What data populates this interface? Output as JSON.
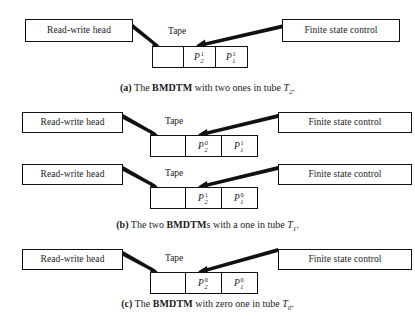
{
  "figure": {
    "background_color": "#ffffff",
    "line_color": "#111111",
    "panels": [
      {
        "id": "a",
        "caption": {
          "label": "(a)",
          "text_before": "The ",
          "acronym": "BMDTM",
          "text_after": " with two ones in tube ",
          "tube_letter": "T",
          "tube_index": "2",
          "period": "."
        },
        "machines": [
          {
            "left_box_label": "Read-write head",
            "right_box_label": "Finite state control",
            "tape_label": "Tape",
            "cells": [
              {
                "blank": true,
                "symbol": "",
                "subscript": "",
                "superscript": ""
              },
              {
                "blank": false,
                "symbol": "P",
                "subscript": "2",
                "superscript": "1"
              },
              {
                "blank": false,
                "symbol": "P",
                "subscript": "1",
                "superscript": "1"
              }
            ]
          }
        ]
      },
      {
        "id": "b",
        "caption": {
          "label": "(b)",
          "text_before": "The two ",
          "acronym": "BMDTM",
          "text_after": "s with a one in tube ",
          "tube_letter": "T",
          "tube_index": "1",
          "period": "."
        },
        "machines": [
          {
            "left_box_label": "Read-write head",
            "right_box_label": "Finite state control",
            "tape_label": "Tape",
            "cells": [
              {
                "blank": true,
                "symbol": "",
                "subscript": "",
                "superscript": ""
              },
              {
                "blank": false,
                "symbol": "P",
                "subscript": "2",
                "superscript": "0"
              },
              {
                "blank": false,
                "symbol": "P",
                "subscript": "1",
                "superscript": "1"
              }
            ]
          },
          {
            "left_box_label": "Read-write head",
            "right_box_label": "Finite state control",
            "tape_label": "Tape",
            "cells": [
              {
                "blank": true,
                "symbol": "",
                "subscript": "",
                "superscript": ""
              },
              {
                "blank": false,
                "symbol": "P",
                "subscript": "2",
                "superscript": "1"
              },
              {
                "blank": false,
                "symbol": "P",
                "subscript": "1",
                "superscript": "0"
              }
            ]
          }
        ]
      },
      {
        "id": "c",
        "caption": {
          "label": "(c)",
          "text_before": "The ",
          "acronym": "BMDTM",
          "text_after": " with zero one in tube ",
          "tube_letter": "T",
          "tube_index": "0",
          "period": "."
        },
        "machines": [
          {
            "left_box_label": "Read-write head",
            "right_box_label": "Finite state control",
            "tape_label": "Tape",
            "cells": [
              {
                "blank": true,
                "symbol": "",
                "subscript": "",
                "superscript": ""
              },
              {
                "blank": false,
                "symbol": "P",
                "subscript": "2",
                "superscript": "0"
              },
              {
                "blank": false,
                "symbol": "P",
                "subscript": "1",
                "superscript": "0"
              }
            ]
          }
        ]
      }
    ]
  }
}
